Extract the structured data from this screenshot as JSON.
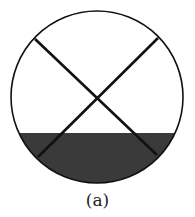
{
  "figure": {
    "caption": "(a)",
    "circle": {
      "cx": 97,
      "cy": 97,
      "r": 86
    },
    "shade_top_y": 133,
    "lines": [
      {
        "x1": 35,
        "y1": 39,
        "x2": 157,
        "y2": 155
      },
      {
        "x1": 158,
        "y1": 38,
        "x2": 38,
        "y2": 157
      }
    ],
    "colors": {
      "stroke": "#111111",
      "shade": "#3a3a3a",
      "background": "#ffffff"
    }
  }
}
